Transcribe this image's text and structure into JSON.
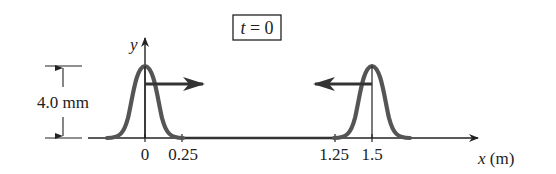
{
  "figure": {
    "time_label": "t = 0",
    "time_label_var": "t",
    "time_label_rest": " = 0",
    "y_axis_label": "y",
    "x_axis_label_var": "x",
    "x_axis_label_unit": " (m)",
    "amplitude_label": "4.0 mm",
    "tick_labels": [
      "0",
      "0.25",
      "1.25",
      "1.5"
    ],
    "pulses": [
      {
        "name": "left-pulse",
        "center_m": 0,
        "half_width_m": 0.25,
        "direction": "right"
      },
      {
        "name": "right-pulse",
        "center_m": 1.5,
        "half_width_m": 0.25,
        "direction": "left"
      }
    ],
    "colors": {
      "pulse": "#555555",
      "axis": "#222222",
      "arrow": "#333333"
    }
  }
}
